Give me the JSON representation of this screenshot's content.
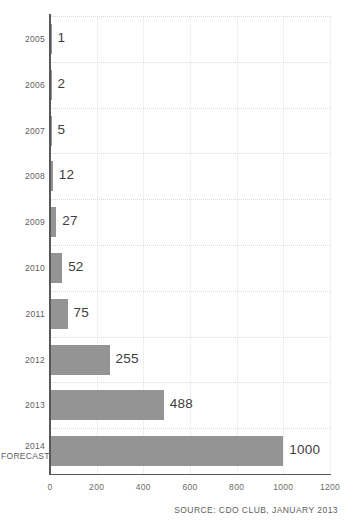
{
  "chart_data": {
    "type": "bar",
    "orientation": "horizontal",
    "title": "",
    "xlabel": "",
    "ylabel": "",
    "xlim": [
      0,
      1200
    ],
    "xticks": [
      "0",
      "200",
      "400",
      "600",
      "800",
      "1000",
      "1200"
    ],
    "grid": true,
    "legend": null,
    "categories": [
      "2005",
      "2006",
      "2007",
      "2008",
      "2009",
      "2010",
      "2011",
      "2012",
      "2013",
      "2014 FORECAST"
    ],
    "values": [
      1,
      2,
      5,
      12,
      27,
      52,
      75,
      255,
      488,
      1000
    ],
    "bars": [
      {
        "category": "2005",
        "category_line1": "2005",
        "category_line2": "",
        "value": 1,
        "value_label": "1"
      },
      {
        "category": "2006",
        "category_line1": "2006",
        "category_line2": "",
        "value": 2,
        "value_label": "2"
      },
      {
        "category": "2007",
        "category_line1": "2007",
        "category_line2": "",
        "value": 5,
        "value_label": "5"
      },
      {
        "category": "2008",
        "category_line1": "2008",
        "category_line2": "",
        "value": 12,
        "value_label": "12"
      },
      {
        "category": "2009",
        "category_line1": "2009",
        "category_line2": "",
        "value": 27,
        "value_label": "27"
      },
      {
        "category": "2010",
        "category_line1": "2010",
        "category_line2": "",
        "value": 52,
        "value_label": "52"
      },
      {
        "category": "2011",
        "category_line1": "2011",
        "category_line2": "",
        "value": 75,
        "value_label": "75"
      },
      {
        "category": "2012",
        "category_line1": "2012",
        "category_line2": "",
        "value": 255,
        "value_label": "255"
      },
      {
        "category": "2013",
        "category_line1": "2013",
        "category_line2": "",
        "value": 488,
        "value_label": "488"
      },
      {
        "category": "2014 FORECAST",
        "category_line1": "2014",
        "category_line2": "FORECAST",
        "value": 1000,
        "value_label": "1000"
      }
    ],
    "annotations": [
      {
        "name": "source",
        "text": "SOURCE: CDO CLUB, JANUARY 2013"
      }
    ],
    "colors": {
      "bar": "#949494",
      "axis": "#585858",
      "grid_vertical": "#f0f0f0",
      "grid_horizontal": "#d8d8d8",
      "value_text": "#3d3d3d",
      "tick_text": "#6b6b6b",
      "background": "#ffffff"
    }
  },
  "source": {
    "text": "SOURCE: CDO CLUB, JANUARY 2013"
  }
}
